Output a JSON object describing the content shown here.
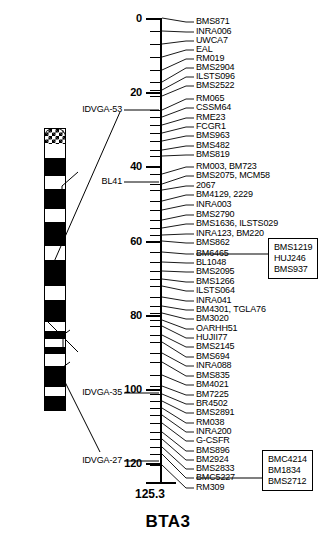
{
  "title": "BTA3",
  "total_length": "125.3",
  "axis": {
    "unit": "cM",
    "labels": [
      "0",
      "20",
      "40",
      "60",
      "80",
      "100",
      "120"
    ],
    "label_positions_cm": [
      0,
      20,
      40,
      60,
      80,
      100,
      120
    ],
    "range_cm": [
      0,
      125.3
    ]
  },
  "chart_data": {
    "type": "table",
    "title": "BTA3",
    "xlabel": "",
    "ylabel": "Position (cM)",
    "ylim": [
      0,
      125.3
    ],
    "axis_ticks": [
      0,
      20,
      40,
      60,
      80,
      100,
      120
    ],
    "total_map_length_cm": 125.3,
    "categories": [
      "BMS871",
      "INRA006",
      "UWCA7",
      "EAL",
      "RM019",
      "BMS2904",
      "ILSTS096",
      "BMS2522",
      "RM065",
      "CSSM64",
      "RME23",
      "FCGR1",
      "BMS963",
      "BMS482",
      "BMS819",
      "RM003, BM723",
      "BMS2075, MCM58",
      "2067",
      "BM4129, 2229",
      "INRA003",
      "BMS2790",
      "BMS1636, ILSTS029",
      "INRA123, BM220",
      "BMS862",
      "BM6465",
      "BL1048",
      "BMS2095",
      "BMS1266",
      "ILSTS064",
      "INRA041",
      "BM4301, TGLA76",
      "BM3020",
      "OARHH51",
      "HUJII77",
      "BMS2145",
      "BMS694",
      "INRA088",
      "BMS835",
      "BM4021",
      "BM7225",
      "BR4502",
      "BMS2891",
      "RM038",
      "INRA200",
      "G-CSFR",
      "BMS896",
      "BM2924",
      "BMS2833",
      "BMC5227",
      "RM309"
    ],
    "values": [
      0.0,
      3.5,
      6.5,
      9.0,
      11.5,
      14.5,
      17.5,
      20.0,
      24.0,
      26.5,
      30.0,
      32.5,
      35.0,
      38.0,
      39.5,
      43.0,
      46.0,
      47.5,
      50.5,
      53.0,
      55.5,
      57.5,
      59.5,
      61.0,
      64.0,
      66.5,
      69.0,
      71.0,
      73.0,
      76.0,
      78.5,
      80.5,
      82.5,
      84.0,
      86.5,
      88.5,
      91.5,
      94.0,
      97.5,
      100.5,
      102.5,
      104.5,
      106.5,
      108.5,
      110.5,
      113.0,
      115.0,
      117.0,
      119.0,
      122.0
    ],
    "grid": false,
    "legend": "none"
  },
  "markers": [
    {
      "label": "BMS871",
      "y": 22,
      "tick": 18
    },
    {
      "label": "INRA006",
      "y": 32,
      "tick": 31
    },
    {
      "label": "UWCA7",
      "y": 41,
      "tick": 44
    },
    {
      "label": "EAL",
      "y": 50,
      "tick": 57
    },
    {
      "label": "RM019",
      "y": 59,
      "tick": 70
    },
    {
      "label": "BMS2904",
      "y": 68,
      "tick": 82
    },
    {
      "label": "ILSTS096",
      "y": 77,
      "tick": 90
    },
    {
      "label": "BMS2522",
      "y": 86,
      "tick": 96
    },
    {
      "label": "RM065",
      "y": 99,
      "tick": 110
    },
    {
      "label": "CSSM64",
      "y": 108,
      "tick": 117
    },
    {
      "label": "RME23",
      "y": 118,
      "tick": 125
    },
    {
      "label": "FCGR1",
      "y": 127,
      "tick": 133
    },
    {
      "label": "BMS963",
      "y": 136,
      "tick": 141
    },
    {
      "label": "BMS482",
      "y": 146,
      "tick": 150
    },
    {
      "label": "BMS819",
      "y": 155,
      "tick": 156
    },
    {
      "label": "RM003, BM723",
      "y": 167,
      "tick": 174
    },
    {
      "label": "BMS2075, MCM58",
      "y": 176,
      "tick": 184
    },
    {
      "label": "2067",
      "y": 186,
      "tick": 190
    },
    {
      "label": "BM4129, 2229",
      "y": 195,
      "tick": 201
    },
    {
      "label": "INRA003",
      "y": 205,
      "tick": 210
    },
    {
      "label": "BMS2790",
      "y": 215,
      "tick": 220
    },
    {
      "label": "BMS1636, ILSTS029",
      "y": 224,
      "tick": 228
    },
    {
      "label": "INRA123, BM220",
      "y": 234,
      "tick": 235
    },
    {
      "label": "BMS862",
      "y": 243,
      "tick": 241
    },
    {
      "label": "BM6465",
      "y": 254,
      "tick": 252
    },
    {
      "label": "BL1048",
      "y": 263,
      "tick": 262
    },
    {
      "label": "BMS2095",
      "y": 272,
      "tick": 271
    },
    {
      "label": "BMS1266",
      "y": 282,
      "tick": 279
    },
    {
      "label": "ILSTS064",
      "y": 291,
      "tick": 286
    },
    {
      "label": "INRA041",
      "y": 301,
      "tick": 297
    },
    {
      "label": "BM4301, TGLA76",
      "y": 310,
      "tick": 306
    },
    {
      "label": "BM3020",
      "y": 319,
      "tick": 313
    },
    {
      "label": "OARHH51",
      "y": 329,
      "tick": 320
    },
    {
      "label": "HUJII77",
      "y": 338,
      "tick": 326
    },
    {
      "label": "BMS2145",
      "y": 347,
      "tick": 335
    },
    {
      "label": "BMS694",
      "y": 357,
      "tick": 342
    },
    {
      "label": "INRA088",
      "y": 366,
      "tick": 353
    },
    {
      "label": "BMS835",
      "y": 376,
      "tick": 362
    },
    {
      "label": "BM4021",
      "y": 385,
      "tick": 375
    },
    {
      "label": "BM7225",
      "y": 395,
      "tick": 386
    },
    {
      "label": "BR4502",
      "y": 404,
      "tick": 394
    },
    {
      "label": "BMS2891",
      "y": 413,
      "tick": 401
    },
    {
      "label": "RM038",
      "y": 423,
      "tick": 408
    },
    {
      "label": "INRA200",
      "y": 432,
      "tick": 415
    },
    {
      "label": "G-CSFR",
      "y": 441,
      "tick": 423
    },
    {
      "label": "BMS896",
      "y": 451,
      "tick": 432
    },
    {
      "label": "BM2924",
      "y": 460,
      "tick": 439
    },
    {
      "label": "BMS2833",
      "y": 469,
      "tick": 447
    },
    {
      "label": "BMC5227",
      "y": 478,
      "tick": 454
    },
    {
      "label": "RM309",
      "y": 488,
      "tick": 465
    }
  ],
  "left_labels": [
    {
      "label": "IDVGA-53",
      "y": 110,
      "tick": 110
    },
    {
      "label": "BL41",
      "y": 182,
      "tick": 182
    },
    {
      "label": "IDVGA-35",
      "y": 393,
      "tick": 393
    },
    {
      "label": "IDVGA-27",
      "y": 461,
      "tick": 461
    }
  ],
  "callouts": [
    {
      "name": "callout-upper",
      "lines": [
        "BMS1219",
        "HUJ246",
        "BMS937"
      ],
      "x": 268,
      "y": 238,
      "anchor_y": 254
    },
    {
      "name": "callout-lower",
      "lines": [
        "BMC4214",
        "BM1834",
        "BMS2712"
      ],
      "x": 262,
      "y": 450,
      "anchor_y": 478
    }
  ],
  "ideogram": {
    "bands": [
      {
        "type": "checker",
        "top": 0,
        "height": 16
      },
      {
        "type": "light",
        "top": 16,
        "height": 14
      },
      {
        "type": "dark",
        "top": 30,
        "height": 18
      },
      {
        "type": "light",
        "top": 48,
        "height": 13
      },
      {
        "type": "dark",
        "top": 61,
        "height": 20
      },
      {
        "type": "light",
        "top": 81,
        "height": 13
      },
      {
        "type": "dark",
        "top": 94,
        "height": 24
      },
      {
        "type": "light",
        "top": 118,
        "height": 14
      },
      {
        "type": "dark",
        "top": 132,
        "height": 26
      },
      {
        "type": "light",
        "top": 158,
        "height": 14
      },
      {
        "type": "dark",
        "top": 172,
        "height": 22
      },
      {
        "type": "light",
        "top": 194,
        "height": 9
      },
      {
        "type": "dark",
        "top": 203,
        "height": 8
      },
      {
        "type": "light",
        "top": 211,
        "height": 8
      },
      {
        "type": "dark",
        "top": 219,
        "height": 7
      },
      {
        "type": "light",
        "top": 226,
        "height": 12
      },
      {
        "type": "dark",
        "top": 238,
        "height": 21
      },
      {
        "type": "light",
        "top": 259,
        "height": 9
      },
      {
        "type": "dark",
        "top": 268,
        "height": 15
      }
    ]
  }
}
